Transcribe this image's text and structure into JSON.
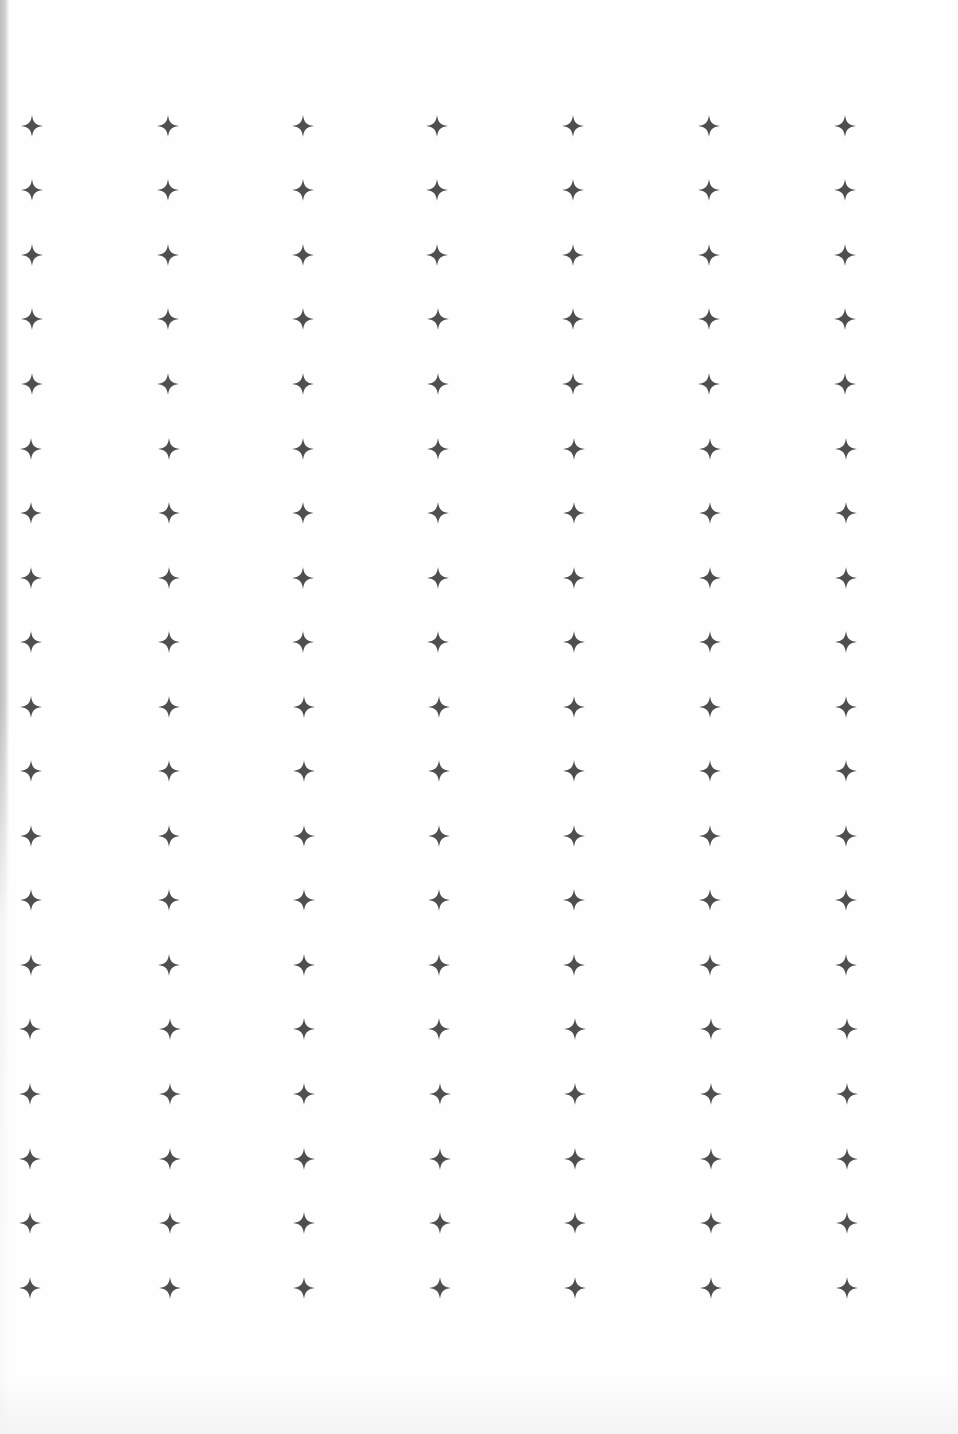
{
  "page": {
    "background": "#fefefe",
    "scan_edge_color": "#c4c4c4"
  },
  "star_grid": {
    "glyph": "four-point-star-icon",
    "glyph_char": "✦",
    "color": "#4f4f4f",
    "size_px": 24,
    "columns": 7,
    "rows": 19,
    "column_x_top": [
      32,
      168,
      303,
      437,
      573,
      709,
      845
    ],
    "column_x_bottom": [
      30,
      170,
      304,
      440,
      575,
      711,
      847
    ],
    "row_y": [
      126,
      190,
      255,
      319,
      384,
      449,
      513,
      578,
      642,
      707,
      771,
      836,
      900,
      965,
      1029,
      1094,
      1159,
      1223,
      1288
    ]
  }
}
